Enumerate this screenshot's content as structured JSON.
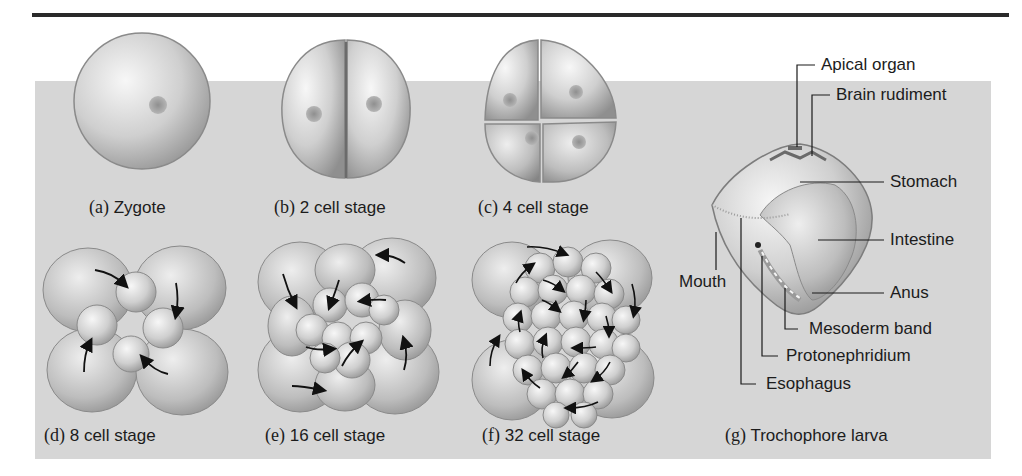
{
  "figure": {
    "panels": [
      {
        "letter": "(a)",
        "label": "Zygote"
      },
      {
        "letter": "(b)",
        "label": "2 cell stage"
      },
      {
        "letter": "(c)",
        "label": "4 cell stage"
      },
      {
        "letter": "(d)",
        "label": "8 cell stage"
      },
      {
        "letter": "(e)",
        "label": "16 cell stage"
      },
      {
        "letter": "(f)",
        "label": "32 cell stage"
      },
      {
        "letter": "(g)",
        "label": "Trochophore larva"
      }
    ],
    "larva_labels": {
      "apical_organ": "Apical organ",
      "brain_rudiment": "Brain rudiment",
      "stomach": "Stomach",
      "intestine": "Intestine",
      "mouth": "Mouth",
      "anus": "Anus",
      "mesoderm_band": "Mesoderm band",
      "protonephridium": "Protonephridium",
      "esophagus": "Esophagus"
    },
    "colors": {
      "panel_bg": "#d6d6d6",
      "cell_light": "#f2f2f2",
      "cell_mid": "#b8b8b8",
      "cell_dark": "#8a8a8a",
      "arrow": "#111111"
    }
  }
}
